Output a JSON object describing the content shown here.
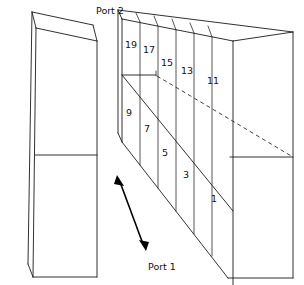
{
  "figure": {
    "background_color": "#ffffff",
    "line_color": "#1a1a1a",
    "width": 304,
    "height": 285
  },
  "labels": {
    "port2": "Port 2",
    "port1": "Port 1"
  },
  "left_block": {
    "name": "left-rectangular-block",
    "description": "3D rectangular prism with one horizontal divider on the front face"
  },
  "right_block": {
    "name": "right-segmented-block",
    "description": "3D rectangular prism divided into vertical slices, numbered top row and bottom row"
  },
  "cells": {
    "top_row": [
      {
        "label": "19",
        "x": 125,
        "y": 40
      },
      {
        "label": "17",
        "x": 143,
        "y": 45
      },
      {
        "label": "15",
        "x": 161,
        "y": 58
      },
      {
        "label": "13",
        "x": 181,
        "y": 66
      },
      {
        "label": "11",
        "x": 207,
        "y": 76
      }
    ],
    "bottom_row": [
      {
        "label": "9",
        "x": 126,
        "y": 108
      },
      {
        "label": "7",
        "x": 144,
        "y": 124
      },
      {
        "label": "5",
        "x": 162,
        "y": 148
      },
      {
        "label": "3",
        "x": 183,
        "y": 170
      },
      {
        "label": "1",
        "x": 211,
        "y": 194
      }
    ]
  },
  "arrow": {
    "name": "port1-double-arrow",
    "from": [
      117,
      176
    ],
    "to": [
      146,
      250
    ],
    "double_headed": true
  },
  "port2_label_position": {
    "x": 96,
    "y": 6
  },
  "port1_label_position": {
    "x": 148,
    "y": 262
  }
}
